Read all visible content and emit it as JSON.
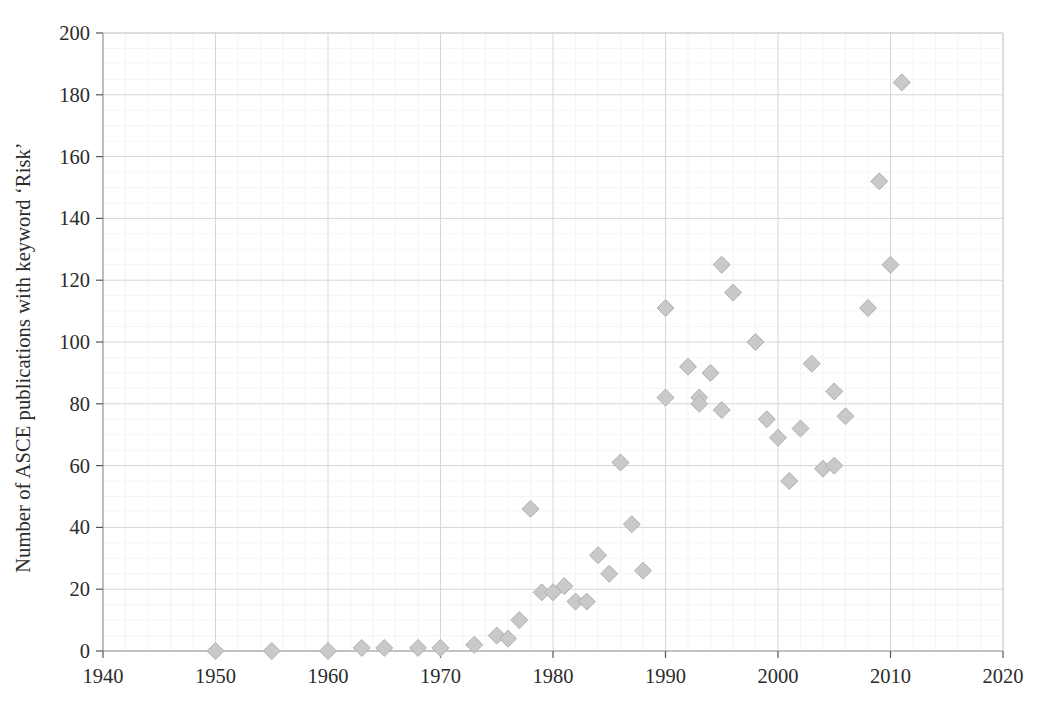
{
  "chart_data": {
    "type": "scatter",
    "title": "",
    "xlabel": "",
    "ylabel": "Number of ASCE publications with keyword ‘Risk’",
    "xlim": [
      1940,
      2020
    ],
    "ylim": [
      0,
      200
    ],
    "xticks": [
      1940,
      1950,
      1960,
      1970,
      1980,
      1990,
      2000,
      2010,
      2020
    ],
    "yticks": [
      0,
      20,
      40,
      60,
      80,
      100,
      120,
      140,
      160,
      180,
      200
    ],
    "x_tick_labels": [
      "1940",
      "1950",
      "1960",
      "1970",
      "1980",
      "1990",
      "2000",
      "2010",
      "2020"
    ],
    "y_tick_labels": [
      "0",
      "20",
      "40",
      "60",
      "80",
      "100",
      "120",
      "140",
      "160",
      "180",
      "200"
    ],
    "grid": true,
    "minor_grid": true,
    "legend": null,
    "marker": "diamond",
    "marker_color": "#c9c9c9",
    "marker_edge_color": "#b0b0b0",
    "series": [
      {
        "name": "ASCE publications with keyword 'Risk'",
        "points": [
          {
            "x": 1950,
            "y": 0
          },
          {
            "x": 1955,
            "y": 0
          },
          {
            "x": 1960,
            "y": 0
          },
          {
            "x": 1963,
            "y": 1
          },
          {
            "x": 1965,
            "y": 1
          },
          {
            "x": 1968,
            "y": 1
          },
          {
            "x": 1970,
            "y": 1
          },
          {
            "x": 1973,
            "y": 2
          },
          {
            "x": 1975,
            "y": 5
          },
          {
            "x": 1976,
            "y": 4
          },
          {
            "x": 1977,
            "y": 10
          },
          {
            "x": 1978,
            "y": 46
          },
          {
            "x": 1979,
            "y": 19
          },
          {
            "x": 1980,
            "y": 19
          },
          {
            "x": 1981,
            "y": 21
          },
          {
            "x": 1982,
            "y": 16
          },
          {
            "x": 1983,
            "y": 16
          },
          {
            "x": 1984,
            "y": 31
          },
          {
            "x": 1985,
            "y": 25
          },
          {
            "x": 1986,
            "y": 61
          },
          {
            "x": 1987,
            "y": 41
          },
          {
            "x": 1988,
            "y": 26
          },
          {
            "x": 1990,
            "y": 111
          },
          {
            "x": 1990,
            "y": 82
          },
          {
            "x": 1992,
            "y": 92
          },
          {
            "x": 1993,
            "y": 82
          },
          {
            "x": 1993,
            "y": 80
          },
          {
            "x": 1994,
            "y": 90
          },
          {
            "x": 1995,
            "y": 78
          },
          {
            "x": 1995,
            "y": 125
          },
          {
            "x": 1996,
            "y": 116
          },
          {
            "x": 1998,
            "y": 100
          },
          {
            "x": 1999,
            "y": 75
          },
          {
            "x": 2000,
            "y": 69
          },
          {
            "x": 2001,
            "y": 55
          },
          {
            "x": 2002,
            "y": 72
          },
          {
            "x": 2003,
            "y": 93
          },
          {
            "x": 2004,
            "y": 59
          },
          {
            "x": 2005,
            "y": 84
          },
          {
            "x": 2005,
            "y": 60
          },
          {
            "x": 2006,
            "y": 76
          },
          {
            "x": 2008,
            "y": 111
          },
          {
            "x": 2009,
            "y": 152
          },
          {
            "x": 2010,
            "y": 125
          },
          {
            "x": 2011,
            "y": 184
          }
        ]
      }
    ]
  },
  "axes": {
    "plot_left_px": 103,
    "plot_right_px": 1003,
    "plot_top_px": 33,
    "plot_bottom_px": 651
  }
}
